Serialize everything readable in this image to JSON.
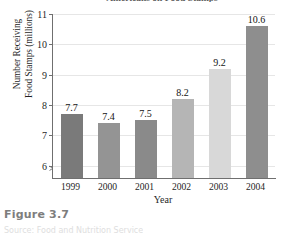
{
  "figure": {
    "caption": "Figure 3.7",
    "subcaption": "Source: Food and Nutrition Service"
  },
  "chart_data": {
    "type": "bar",
    "title": "Americans on Food Stamps",
    "xlabel": "Year",
    "ylabel": "Number Receiving Food Stamps (millions)",
    "ylabel_line1": "Number Receiving",
    "ylabel_line2": "Food Stamps (millions)",
    "categories": [
      "1999",
      "2000",
      "2001",
      "2002",
      "2003",
      "2004"
    ],
    "values": [
      7.7,
      7.4,
      7.5,
      8.2,
      9.2,
      10.6
    ],
    "value_labels": [
      "7.7",
      "7.4",
      "7.5",
      "8.2",
      "9.2",
      "10.6"
    ],
    "bar_colors": [
      "#7a7a7a",
      "#949494",
      "#8a8a8a",
      "#b5b5b5",
      "#d8d8d8",
      "#8e8e8e"
    ],
    "ylim": [
      5.6,
      11
    ],
    "yticks": [
      6,
      7,
      8,
      9,
      10,
      11
    ],
    "ytick_labels": [
      "6",
      "7",
      "8",
      "9",
      "10",
      "11"
    ],
    "grid": true,
    "axis_break": true,
    "legend": "none"
  }
}
